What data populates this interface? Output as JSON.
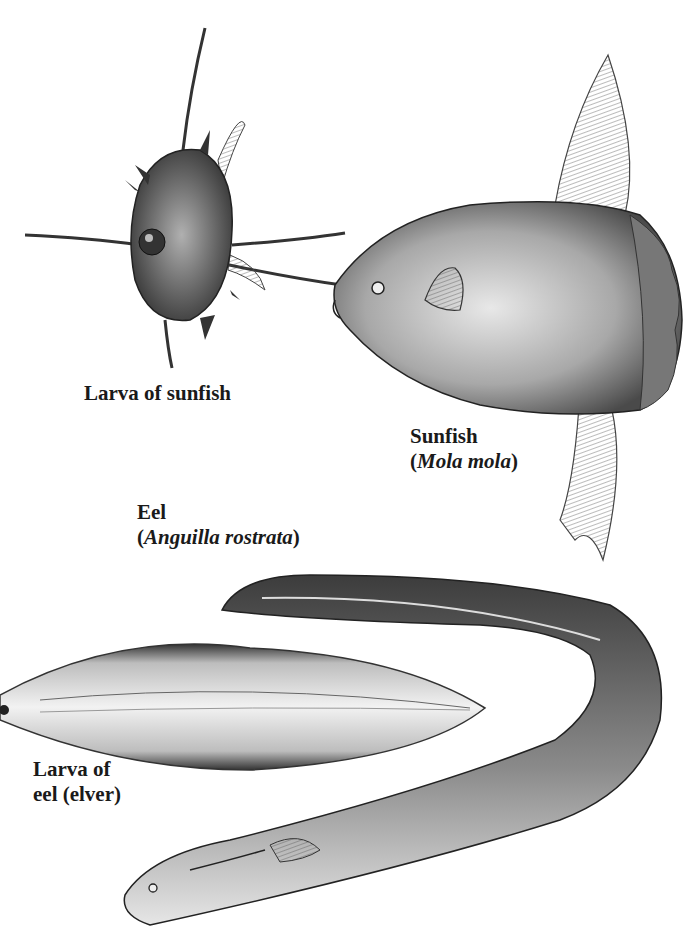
{
  "figure": {
    "background": "#ffffff",
    "ink_color": "#1a1a1a",
    "labels": {
      "larva_sunfish": "Larva of sunfish",
      "sunfish_common": "Sunfish",
      "sunfish_sci_open": "(",
      "sunfish_sci": "Mola mola",
      "sunfish_sci_close": ")",
      "eel_common": "Eel",
      "eel_sci_open": "(",
      "eel_sci": "Anguilla rostrata",
      "eel_sci_close": ")",
      "elver_line1": "Larva of",
      "elver_line2": "eel (elver)"
    },
    "subjects": [
      {
        "name": "sunfish-larva",
        "label": "Larva of sunfish"
      },
      {
        "name": "sunfish",
        "label": "Sunfish (Mola mola)"
      },
      {
        "name": "eel",
        "label": "Eel (Anguilla rostrata)"
      },
      {
        "name": "eel-larva",
        "label": "Larva of eel (elver)"
      }
    ]
  }
}
